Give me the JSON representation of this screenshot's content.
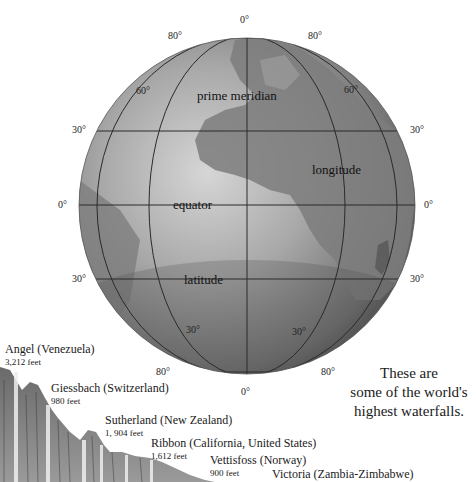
{
  "globe": {
    "labels": {
      "prime_meridian": "prime meridian",
      "longitude": "longitude",
      "equator": "equator",
      "latitude": "latitude"
    },
    "degree_marks": {
      "top_center": "0°",
      "top_left_80": "80°",
      "top_right_80": "80°",
      "left_60": "60°",
      "right_60": "60°",
      "left_30_north": "30°",
      "right_30_north": "30°",
      "left_0": "0°",
      "right_0": "0°",
      "left_30_south": "30°",
      "right_30_south": "30°",
      "bottom_left_30": "30°",
      "bottom_right_30": "30°",
      "bottom_left_80": "80°",
      "bottom_right_80": "80°",
      "bottom_center": "0°"
    },
    "colors": {
      "ocean_light": "#c9c9c9",
      "ocean_mid": "#9a9a9a",
      "land": "#7a7a7a",
      "grid_line": "#2a2a2a"
    }
  },
  "waterfalls": [
    {
      "name": "Angel (Venezuela)",
      "height": "3,212 feet"
    },
    {
      "name": "Giessbach (Switzerland)",
      "height": "980 feet"
    },
    {
      "name": "Sutherland (New Zealand)",
      "height": "1, 904 feet"
    },
    {
      "name": "Ribbon (California, United States)",
      "height": "1,612 feet"
    },
    {
      "name": "Vettisfoss (Norway)",
      "height": "900 feet"
    },
    {
      "name": "Victoria (Zambia-Zimbabwe)",
      "height": ""
    }
  ],
  "caption": {
    "line1": "These are",
    "line2": "some of the world's",
    "line3": "highest waterfalls."
  }
}
